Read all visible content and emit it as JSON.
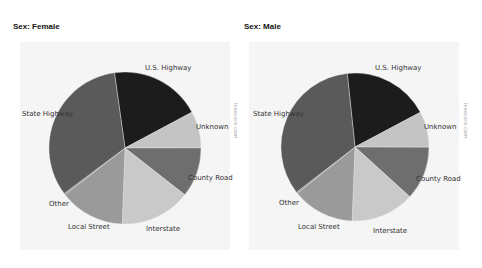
{
  "chart_data": [
    {
      "type": "pie",
      "title": "Sex: Female",
      "categories": [
        "U.S. Highway",
        "Unknown",
        "County Road",
        "Interstate",
        "Local Street",
        "Other",
        "State Highway"
      ],
      "values": [
        19.4,
        7.8,
        10.6,
        15.0,
        13.9,
        0.3,
        33.0
      ],
      "colors": [
        "#1c1c1c",
        "#c4c4c4",
        "#6e6e6e",
        "#c9c9c9",
        "#9a9a9a",
        "#8a8a8a",
        "#5a5a5a"
      ],
      "start_angle_deg": 352,
      "legend": "none (labels on slices)"
    },
    {
      "type": "pie",
      "title": "Sex: Male",
      "categories": [
        "U.S. Highway",
        "Unknown",
        "County Road",
        "Interstate",
        "Local Street",
        "Other",
        "State Highway"
      ],
      "values": [
        18.9,
        7.8,
        11.7,
        13.9,
        13.6,
        0.3,
        33.8
      ],
      "colors": [
        "#1c1c1c",
        "#c4c4c4",
        "#6e6e6e",
        "#c9c9c9",
        "#9a9a9a",
        "#8a8a8a",
        "#5a5a5a"
      ],
      "start_angle_deg": 354,
      "legend": "none (labels on slices)"
    }
  ],
  "charts": [
    {
      "title": "Sex: Female",
      "watermark": "iseecars.com",
      "labels": {
        "us_highway": "U.S. Highway",
        "state_highway": "State Highway",
        "unknown": "Unknown",
        "county_road": "County Road",
        "other": "Other",
        "local_street": "Local Street",
        "interstate": "Interstate"
      }
    },
    {
      "title": "Sex: Male",
      "watermark": "iseecars.com",
      "labels": {
        "us_highway": "U.S. Highway",
        "state_highway": "State Highway",
        "unknown": "Unknown",
        "county_road": "County Road",
        "other": "Other",
        "local_street": "Local Street",
        "interstate": "Interstate"
      }
    }
  ]
}
